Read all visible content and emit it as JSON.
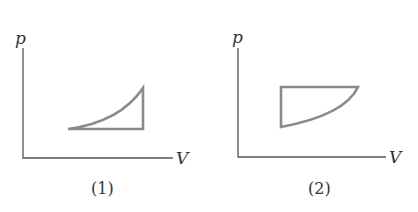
{
  "figures": [
    {
      "caption": "(1)",
      "y_axis_label": "p",
      "x_axis_label": "V",
      "description": "Closed cycle: horizontal bottom segment, vertical right segment, concave-up curve from lower-left to upper-right"
    },
    {
      "caption": "(2)",
      "y_axis_label": "p",
      "x_axis_label": "V",
      "description": "Closed cycle: horizontal top segment, vertical left segment, concave-down curve from lower-left to upper-right"
    }
  ],
  "colors": {
    "axis": "#555555",
    "cycle": "#8a8a8a",
    "text": "#333333",
    "background": "#ffffff"
  }
}
